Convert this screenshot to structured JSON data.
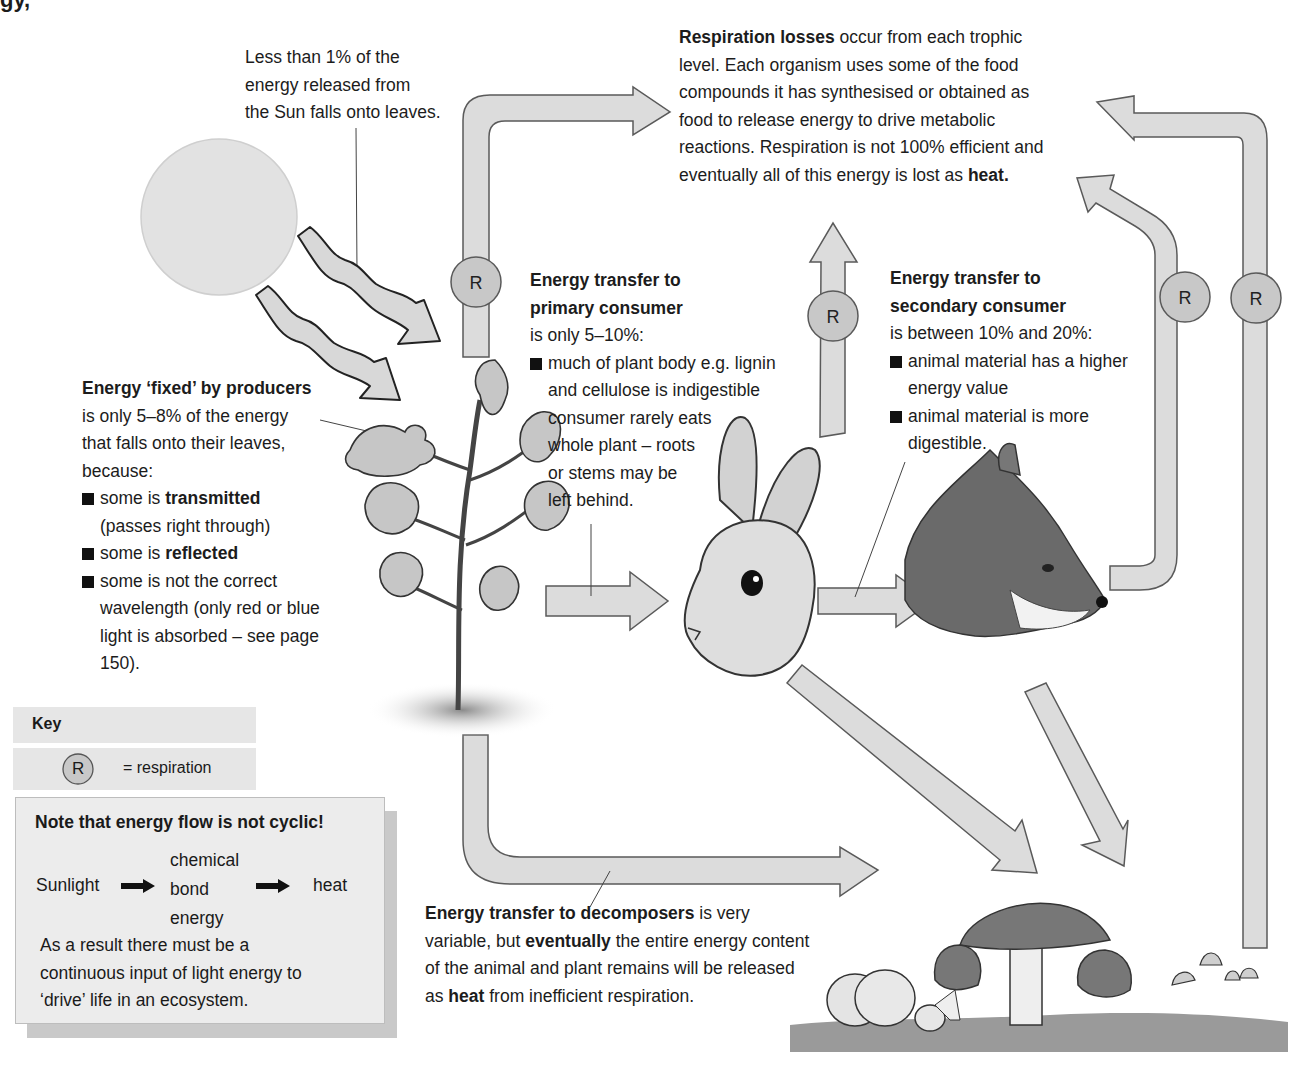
{
  "header": {
    "partial_title": "gy,"
  },
  "sun": {
    "icon": "sun-circle",
    "caption": [
      "Less than 1% of the",
      "energy released from",
      "the Sun falls onto leaves."
    ]
  },
  "respiration_losses": {
    "title": "Respiration losses",
    "lines": [
      "occur from each trophic",
      "level. Each organism uses some of the food",
      "compounds it has synthesised or obtained as",
      "food to release energy to drive metabolic",
      "reactions. Respiration is not 100% efficient and",
      "eventually all of this energy is lost as"
    ],
    "final_bold": "heat."
  },
  "producers": {
    "title": "Energy ‘fixed’ by producers",
    "intro": [
      "is only 5–8% of the energy",
      "that falls onto their leaves,",
      "because:"
    ],
    "bullets": [
      {
        "pre": "some is ",
        "bold": "transmitted",
        "rest": "(passes right through)"
      },
      {
        "pre": "some is ",
        "bold": "reflected",
        "rest": ""
      },
      {
        "pre": "some is not the correct",
        "bold": "",
        "rest": "wavelength (only red or blue light is absorbed – see page 150)."
      }
    ]
  },
  "primary_consumer": {
    "title_1": "Energy transfer to",
    "title_2": "primary consumer",
    "intro": "is only 5–10%:",
    "bullet_lines": [
      "much of plant body e.g. lignin",
      "and cellulose is indigestible",
      "consumer rarely eats",
      "whole plant – roots",
      "or stems may be",
      "left behind."
    ]
  },
  "secondary_consumer": {
    "title_1": "Energy transfer to",
    "title_2": "secondary consumer",
    "intro": "is between 10% and 20%:",
    "bullets": [
      [
        "animal material has a higher",
        "energy value"
      ],
      [
        "animal material is more",
        "digestible."
      ]
    ]
  },
  "decomposers": {
    "title": "Energy transfer to decomposers",
    "line1_rest": "is very",
    "line2_pre": "variable, but",
    "line2_bold": "eventually",
    "line2_rest": "the entire energy content",
    "line3": "of the animal and plant remains will be released",
    "line4_pre": "as",
    "line4_bold": "heat",
    "line4_rest": "from inefficient respiration."
  },
  "key": {
    "title": "Key",
    "symbol": "R",
    "meaning": "= respiration"
  },
  "note": {
    "title": "Note that energy flow is not cyclic!",
    "flow": [
      "Sunlight",
      "chemical",
      "bond",
      "energy",
      "heat"
    ],
    "body": [
      "As a result there must be a",
      "continuous input of light energy to",
      "‘drive’ life in an ecosystem."
    ]
  },
  "respiration_markers": [
    "R",
    "R",
    "R",
    "R"
  ],
  "organisms": [
    "sun",
    "oak-seedling",
    "rabbit",
    "fox",
    "mushrooms"
  ],
  "colors": {
    "arrow_fill": "#dcdcdc",
    "arrow_stroke": "#5a5a5a",
    "sun_fill": "#e0e0e0",
    "r_fill": "#c8c8c8",
    "key_bg": "#e6e6e6"
  }
}
